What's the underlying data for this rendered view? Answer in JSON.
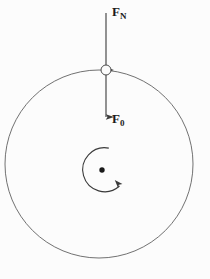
{
  "figure": {
    "type": "physics-force-diagram",
    "background_color": "#fcfcfc",
    "stroke_color": "#4d4d4d",
    "ink_color": "#1a1a1a",
    "canvas": {
      "width": 210,
      "height": 279
    }
  },
  "labels": {
    "normal_force": {
      "symbol": "F",
      "subscript": "N",
      "full": "F_N"
    },
    "applied_force": {
      "symbol": "F",
      "subscript": "0",
      "full": "F_0"
    }
  },
  "elements": {
    "body_circle": {
      "name": "large-circle",
      "center_x": 99,
      "center_y": 164,
      "radius": 94,
      "filled": false
    },
    "particle_circle": {
      "name": "small-circle-particle",
      "center_x": 106,
      "center_y": 70,
      "radius": 5,
      "filled": false
    },
    "center_dot": {
      "name": "center-point",
      "center_x": 102,
      "center_y": 170,
      "radius": 2.6,
      "filled": true
    },
    "normal_force_arrow": {
      "name": "up-arrow",
      "x": 106,
      "tail_y": 70,
      "head_y": 9,
      "direction": "up"
    },
    "applied_force_arrow": {
      "name": "down-arrow",
      "x": 106,
      "tail_y": 70,
      "head_y": 121,
      "direction": "down"
    },
    "rotation_arc": {
      "name": "rotation-arrow",
      "center_x": 102,
      "center_y": 170,
      "radius": 22,
      "start_angle_deg": -72,
      "end_angle_deg": 214,
      "sweep": "counterclockwise-sweep-arrowhead-lower-right"
    }
  }
}
